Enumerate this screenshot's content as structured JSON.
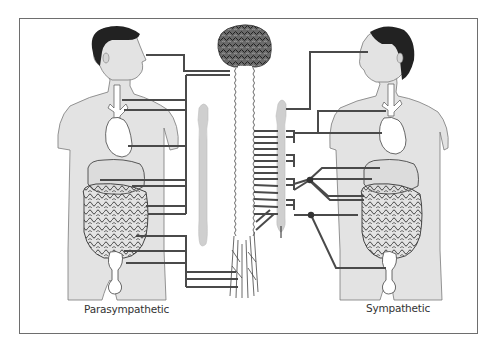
{
  "figure": {
    "labels": {
      "left": "Parasympathetic",
      "right": "Sympathetic"
    },
    "colors": {
      "frame": "#6e6e6e",
      "nerve": "#4a4a4a",
      "body_fill": "#e3e3e3",
      "body_outline": "#7a7a7a",
      "hair": "#222222",
      "brain": "#555555",
      "chain": "#cfcfcf",
      "background": "#ffffff"
    },
    "elements": {
      "center": [
        "brain",
        "spinal-cord",
        "vertebral-nerves"
      ],
      "left_figure": [
        "head",
        "eye",
        "trachea",
        "heart",
        "liver",
        "stomach",
        "intestines",
        "bladder",
        "genitals"
      ],
      "right_figure": [
        "head",
        "eye",
        "trachea",
        "heart",
        "liver",
        "stomach",
        "intestines",
        "bladder",
        "genitals"
      ],
      "left_chain": "parasympathetic-ganglia-column",
      "right_chain": "sympathetic-ganglion-chain"
    }
  }
}
